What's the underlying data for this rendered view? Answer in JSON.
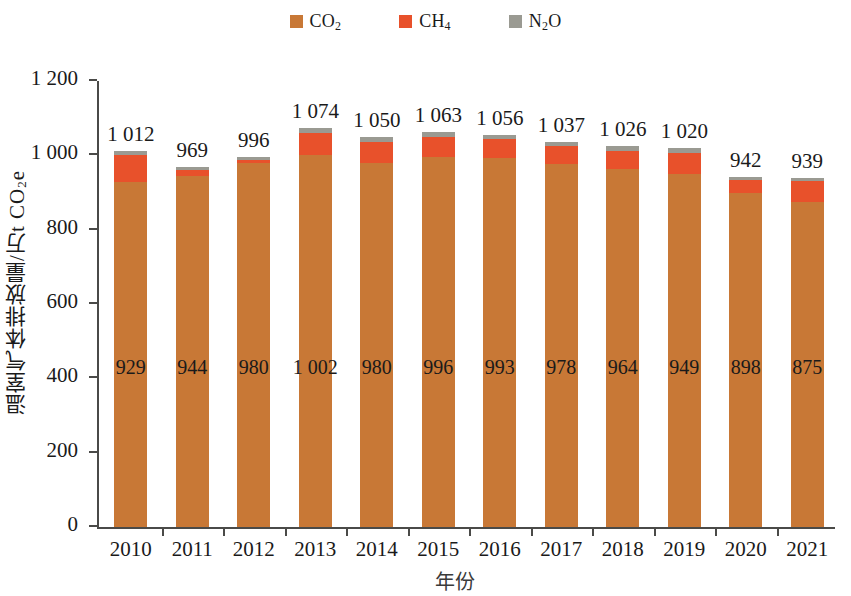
{
  "chart_data": {
    "type": "bar",
    "stacked": true,
    "title": "",
    "xlabel": "年份",
    "ylabel": "温室气体排放量/万t CO₂e",
    "ylim": [
      0,
      1200
    ],
    "ytick_step": 200,
    "ytick_labels": [
      "1 200",
      "1 000",
      "800",
      "600",
      "400",
      "200",
      "0"
    ],
    "ytick_values": [
      1200,
      1000,
      800,
      600,
      400,
      200,
      0
    ],
    "grid": false,
    "legend_position": "top-center",
    "categories": [
      "2010",
      "2011",
      "2012",
      "2013",
      "2014",
      "2015",
      "2016",
      "2017",
      "2018",
      "2019",
      "2020",
      "2021"
    ],
    "series": [
      {
        "name": "CO2",
        "label": "CO₂",
        "color": "#c87836",
        "values": [
          929,
          944,
          980,
          1002,
          980,
          996,
          993,
          978,
          964,
          949,
          898,
          875
        ],
        "value_labels": [
          "929",
          "944",
          "980",
          "1 002",
          "980",
          "996",
          "993",
          "978",
          "964",
          "949",
          "898",
          "875"
        ]
      },
      {
        "name": "CH4",
        "label": "CH₄",
        "color": "#e8512b",
        "values": [
          72,
          16,
          7,
          59,
          57,
          54,
          50,
          46,
          49,
          58,
          37,
          55
        ]
      },
      {
        "name": "N2O",
        "label": "N₂O",
        "color": "#9a9a92",
        "values": [
          11,
          9,
          9,
          13,
          13,
          13,
          13,
          13,
          13,
          13,
          7,
          9
        ]
      }
    ],
    "totals": [
      1012,
      969,
      996,
      1074,
      1050,
      1063,
      1056,
      1037,
      1026,
      1020,
      942,
      939
    ],
    "total_labels": [
      "1 012",
      "969",
      "996",
      "1 074",
      "1 050",
      "1 063",
      "1 056",
      "1 037",
      "1 026",
      "1 020",
      "942",
      "939"
    ]
  },
  "legend": {
    "items": [
      {
        "label_main": "CO",
        "label_sub": "2",
        "label_tail": "",
        "color": "#c87836",
        "icon": "square-swatch-co2"
      },
      {
        "label_main": "CH",
        "label_sub": "4",
        "label_tail": "",
        "color": "#e8512b",
        "icon": "square-swatch-ch4"
      },
      {
        "label_main": "N",
        "label_sub": "2",
        "label_tail": "O",
        "color": "#9a9a92",
        "icon": "square-swatch-n2o"
      }
    ]
  },
  "axis": {
    "y_title_main": "温室气体排放量/万t CO",
    "y_title_sub": "2",
    "y_title_tail": "e",
    "x_title": "年份"
  }
}
